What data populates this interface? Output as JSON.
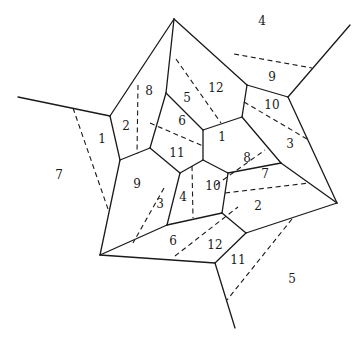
{
  "diagram": {
    "type": "planar-subdivision",
    "stroke_color": "#1a1a1a",
    "background": "#ffffff",
    "solid_edges": [
      [
        174,
        19,
        110,
        116
      ],
      [
        110,
        116,
        18,
        97
      ],
      [
        174,
        19,
        166,
        93
      ],
      [
        166,
        93,
        150,
        148
      ],
      [
        150,
        148,
        120,
        160
      ],
      [
        110,
        116,
        120,
        160
      ],
      [
        120,
        160,
        100,
        255
      ],
      [
        174,
        19,
        247,
        85
      ],
      [
        247,
        85,
        242,
        117
      ],
      [
        242,
        117,
        203,
        130
      ],
      [
        203,
        130,
        166,
        93
      ],
      [
        203,
        130,
        203,
        160
      ],
      [
        150,
        148,
        180,
        173
      ],
      [
        180,
        173,
        203,
        160
      ],
      [
        203,
        160,
        228,
        173
      ],
      [
        228,
        173,
        222,
        213
      ],
      [
        180,
        173,
        167,
        225
      ],
      [
        167,
        225,
        222,
        213
      ],
      [
        167,
        225,
        100,
        255
      ],
      [
        100,
        255,
        215,
        263
      ],
      [
        215,
        263,
        246,
        233
      ],
      [
        222,
        213,
        246,
        233
      ],
      [
        246,
        233,
        337,
        203
      ],
      [
        215,
        263,
        235,
        328
      ],
      [
        228,
        173,
        281,
        163
      ],
      [
        242,
        117,
        281,
        163
      ],
      [
        281,
        163,
        337,
        203
      ],
      [
        247,
        85,
        288,
        97
      ],
      [
        288,
        97,
        350,
        25
      ],
      [
        288,
        97,
        337,
        203
      ]
    ],
    "dashed_edges": [
      [
        73,
        108,
        108,
        209
      ],
      [
        138,
        85,
        137,
        154
      ],
      [
        176,
        59,
        221,
        123
      ],
      [
        150,
        123,
        203,
        146
      ],
      [
        234,
        54,
        312,
        68
      ],
      [
        244,
        102,
        307,
        139
      ],
      [
        216,
        185,
        265,
        150
      ],
      [
        225,
        193,
        309,
        183
      ],
      [
        164,
        188,
        133,
        243
      ],
      [
        192,
        166,
        193,
        218
      ],
      [
        175,
        256,
        238,
        207
      ],
      [
        292,
        219,
        227,
        300
      ]
    ],
    "labels": [
      {
        "text": "4",
        "x": 262,
        "y": 21
      },
      {
        "text": "9",
        "x": 272,
        "y": 77
      },
      {
        "text": "10",
        "x": 272,
        "y": 105
      },
      {
        "text": "12",
        "x": 216,
        "y": 88
      },
      {
        "text": "8",
        "x": 149,
        "y": 91
      },
      {
        "text": "5",
        "x": 187,
        "y": 98
      },
      {
        "text": "2",
        "x": 126,
        "y": 126
      },
      {
        "text": "6",
        "x": 182,
        "y": 121
      },
      {
        "text": "1",
        "x": 102,
        "y": 139
      },
      {
        "text": "1",
        "x": 222,
        "y": 137
      },
      {
        "text": "3",
        "x": 290,
        "y": 144
      },
      {
        "text": "7",
        "x": 59,
        "y": 175
      },
      {
        "text": "11",
        "x": 177,
        "y": 153
      },
      {
        "text": "8",
        "x": 247,
        "y": 158
      },
      {
        "text": "7",
        "x": 265,
        "y": 174
      },
      {
        "text": "9",
        "x": 137,
        "y": 184
      },
      {
        "text": "10",
        "x": 213,
        "y": 186
      },
      {
        "text": "4",
        "x": 183,
        "y": 197
      },
      {
        "text": "3",
        "x": 160,
        "y": 204
      },
      {
        "text": "2",
        "x": 258,
        "y": 206
      },
      {
        "text": "6",
        "x": 173,
        "y": 241
      },
      {
        "text": "12",
        "x": 215,
        "y": 245
      },
      {
        "text": "11",
        "x": 238,
        "y": 260
      },
      {
        "text": "5",
        "x": 292,
        "y": 279
      }
    ]
  }
}
